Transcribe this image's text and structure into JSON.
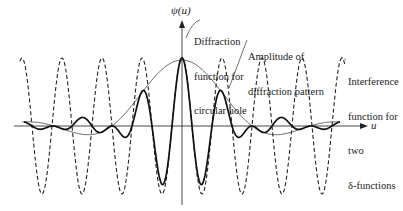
{
  "figure": {
    "y_axis_label": "ψ(u)",
    "x_axis_label": "u",
    "annotations": {
      "diffraction": [
        "Diffraction",
        "function for",
        "circular hole"
      ],
      "amplitude": [
        "Amplitude of",
        "diffraction pattern"
      ],
      "interference": [
        "Interference",
        "function for",
        "two",
        "δ-functions"
      ]
    }
  },
  "chart_data": {
    "type": "line",
    "title": "",
    "xlabel": "u",
    "ylabel": "ψ(u)",
    "grid": false,
    "legend": "annotation labels with leader lines",
    "series": [
      {
        "name": "Interference function for two δ-functions",
        "style": "dashed",
        "form": "cos(k·u), constant amplitude 1",
        "period_units": 1.0
      },
      {
        "name": "Diffraction function for circular hole",
        "style": "thin solid",
        "form": "2·J1(a·u)/(a·u) (Airy amplitude envelope), peak 1 at u=0, first zero near u≈±1.75 periods"
      },
      {
        "name": "Amplitude of diffraction pattern",
        "style": "thick solid",
        "form": "product of interference and diffraction functions"
      }
    ],
    "x_range_periods": [
      -4.2,
      4.6
    ],
    "y_range": [
      -1,
      1
    ]
  }
}
